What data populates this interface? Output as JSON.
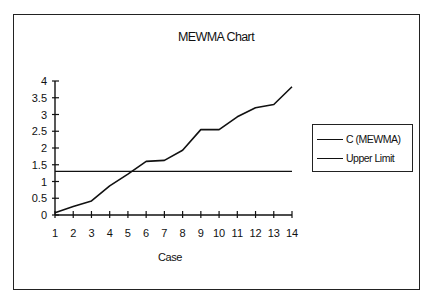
{
  "chart_data": {
    "type": "line",
    "title": "MEWMA Chart",
    "xlabel": "Case",
    "ylabel": "",
    "x": [
      1,
      2,
      3,
      4,
      5,
      6,
      7,
      8,
      9,
      10,
      11,
      12,
      13,
      14
    ],
    "series": [
      {
        "name": "C (MEWMA)",
        "values": [
          0.07,
          0.25,
          0.42,
          0.87,
          1.22,
          1.6,
          1.63,
          1.93,
          2.55,
          2.55,
          2.93,
          3.2,
          3.3,
          3.83
        ]
      },
      {
        "name": "Upper Limit",
        "values": [
          1.3,
          1.3,
          1.3,
          1.3,
          1.3,
          1.3,
          1.3,
          1.3,
          1.3,
          1.3,
          1.3,
          1.3,
          1.3,
          1.3
        ]
      }
    ],
    "ylim": [
      0,
      4
    ],
    "yticks": [
      "0",
      "0.5",
      "1",
      "1.5",
      "2",
      "2.5",
      "3",
      "3.5",
      "4"
    ],
    "xticks": [
      "1",
      "2",
      "3",
      "4",
      "5",
      "6",
      "7",
      "8",
      "9",
      "10",
      "11",
      "12",
      "13",
      "14"
    ],
    "grid": false,
    "legend_position": "right"
  },
  "legend": {
    "items": [
      {
        "label": "C (MEWMA)"
      },
      {
        "label": "Upper Limit"
      }
    ]
  }
}
